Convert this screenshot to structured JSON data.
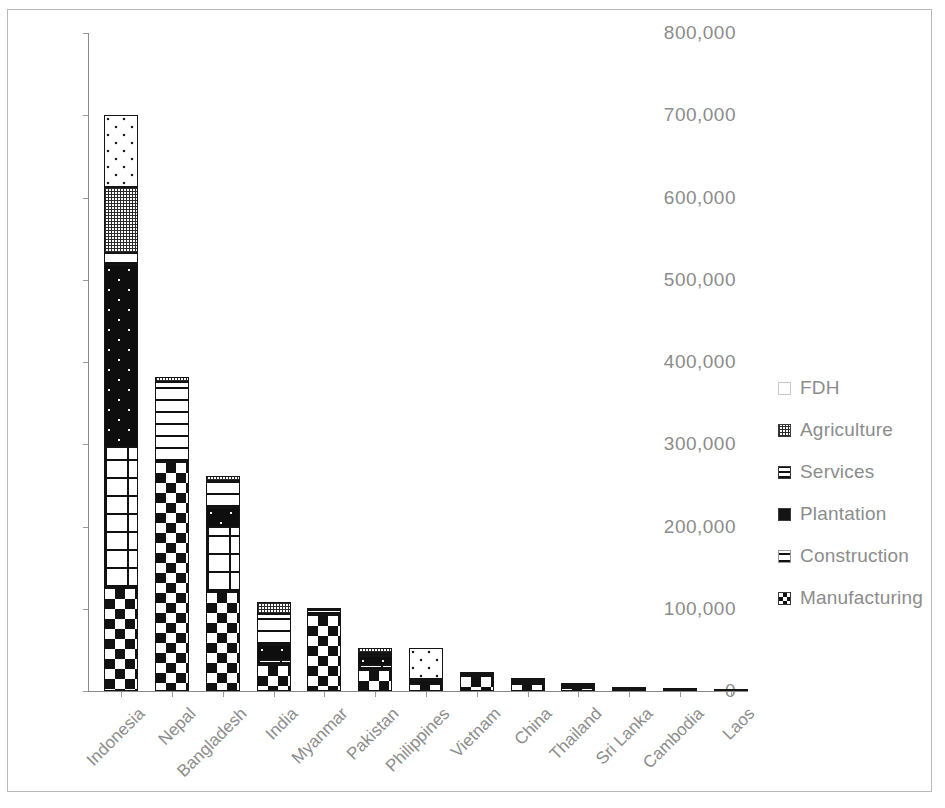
{
  "chart_data": {
    "type": "bar",
    "subtype": "stacked-bar",
    "title": "",
    "subtitle": "",
    "xlabel": "",
    "ylabel": "",
    "ylim": [
      0,
      800000
    ],
    "ytick_values": [
      0,
      100000,
      200000,
      300000,
      400000,
      500000,
      600000,
      700000,
      800000
    ],
    "ytick_labels": [
      "0",
      "100,000",
      "200,000",
      "300,000",
      "400,000",
      "500,000",
      "600,000",
      "700,000",
      "800,000"
    ],
    "grid": false,
    "legend_position": "right",
    "categories": [
      "Indonesia",
      "Nepal",
      "Bangladesh",
      "India",
      "Myanmar",
      "Pakistan",
      "Philippines",
      "Vietnam",
      "China",
      "Thailand",
      "Sri Lanka",
      "Cambodia",
      "Laos"
    ],
    "series": [
      {
        "name": "Manufacturing",
        "pattern": "checkerboard",
        "values": [
          125000,
          278000,
          120000,
          32000,
          92000,
          25000,
          9000,
          18000,
          8000,
          4000,
          1500,
          800,
          300
        ]
      },
      {
        "name": "Construction",
        "pattern": "brick",
        "values": [
          172000,
          0,
          80000,
          6000,
          0,
          7000,
          0,
          0,
          2000,
          1000,
          500,
          200,
          100
        ]
      },
      {
        "name": "Plantation",
        "pattern": "black-dots",
        "values": [
          221000,
          0,
          22000,
          18000,
          0,
          11000,
          3500,
          1500,
          500,
          200,
          100,
          100,
          50
        ]
      },
      {
        "name": "Services",
        "pattern": "horizontal-lines",
        "values": [
          15000,
          98000,
          33000,
          38000,
          6000,
          3000,
          1500,
          1000,
          2500,
          2000,
          800,
          300,
          100
        ]
      },
      {
        "name": "Agriculture",
        "pattern": "fine-crosshatch",
        "values": [
          80000,
          6000,
          7000,
          14000,
          500,
          6000,
          500,
          300,
          200,
          500,
          200,
          100,
          50
        ]
      },
      {
        "name": "FDH",
        "pattern": "sparse-dots",
        "values": [
          87000,
          0,
          0,
          0,
          0,
          0,
          37500,
          0,
          0,
          0,
          0,
          0,
          0
        ]
      }
    ],
    "totals": [
      700000,
      382000,
      262000,
      108000,
      98500,
      52000,
      52000,
      20800,
      13200,
      7700,
      3100,
      1500,
      600
    ]
  },
  "legend": {
    "items": [
      {
        "label": "FDH",
        "swatch": "fdh-swatch-icon"
      },
      {
        "label": "Agriculture",
        "swatch": "agriculture-swatch-icon"
      },
      {
        "label": "Services",
        "swatch": "services-swatch-icon"
      },
      {
        "label": "Plantation",
        "swatch": "plantation-swatch-icon"
      },
      {
        "label": "Construction",
        "swatch": "construction-swatch-icon"
      },
      {
        "label": "Manufacturing",
        "swatch": "manufacturing-swatch-icon"
      }
    ]
  },
  "colors": {
    "axis": "#8a8a8a",
    "tick_text": "#8c8c8c",
    "bar_outline": "#141414",
    "background": "#ffffff",
    "frame": "#b9b9b9"
  }
}
